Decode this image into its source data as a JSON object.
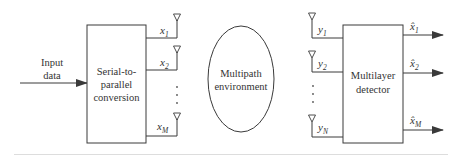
{
  "diagram": {
    "input_label": [
      "Input",
      "data"
    ],
    "transmitter_block": [
      "Serial-to-",
      "parallel",
      "conversion"
    ],
    "channel_label": [
      "Multipath",
      "environment"
    ],
    "receiver_block": [
      "Multilayer",
      "detector"
    ],
    "tx_antennas": [
      {
        "var": "x",
        "sub": "1"
      },
      {
        "var": "x",
        "sub": "2"
      },
      {
        "var": "x",
        "sub": "M"
      }
    ],
    "rx_antennas": [
      {
        "var": "y",
        "sub": "1"
      },
      {
        "var": "y",
        "sub": "2"
      },
      {
        "var": "y",
        "sub": "N"
      }
    ],
    "outputs": [
      {
        "var": "x̂",
        "sub": "1"
      },
      {
        "var": "x̂",
        "sub": "2"
      },
      {
        "var": "x̂",
        "sub": "M"
      }
    ],
    "ellipsis": "⋮",
    "colors": {
      "stroke": "#3a3a3a",
      "text": "#333333",
      "baseline": "#dddddd"
    }
  }
}
